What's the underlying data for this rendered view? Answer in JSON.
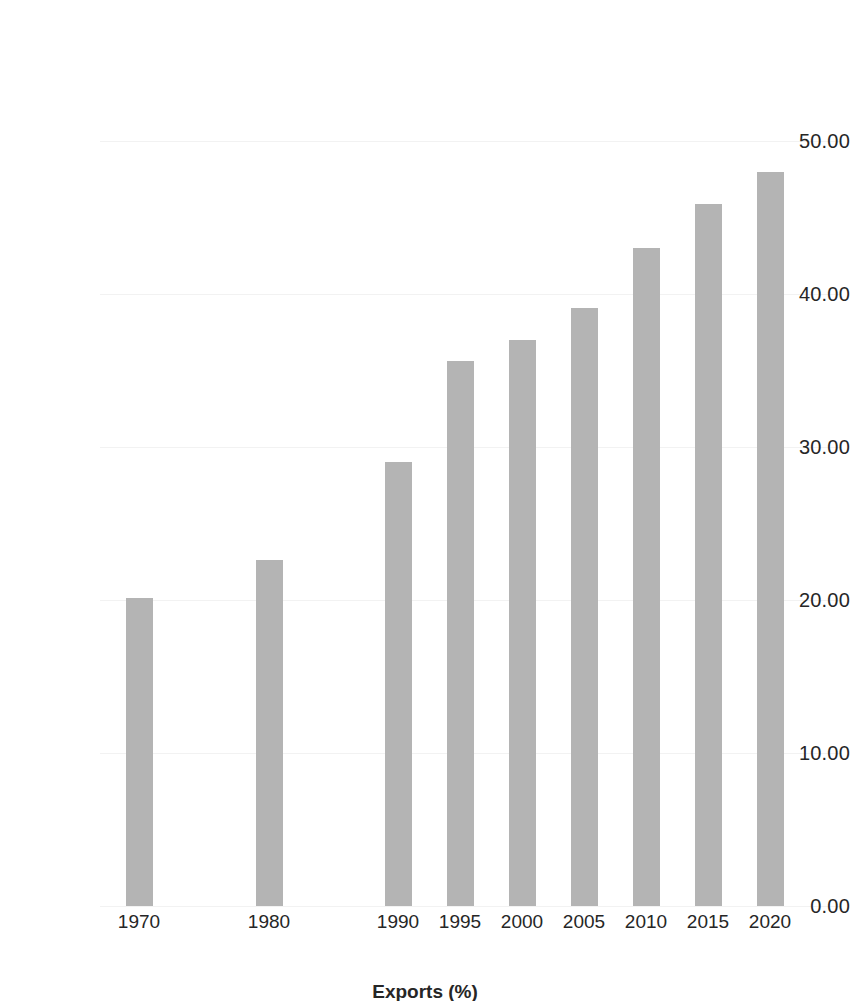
{
  "chart_data": {
    "type": "bar",
    "title": "",
    "subtitle": "",
    "xlabel": "",
    "ylabel": "",
    "categories": [
      "1970",
      "1980",
      "1990",
      "1995",
      "2000",
      "2005",
      "2010",
      "2015",
      "2020"
    ],
    "values": [
      20.1,
      22.6,
      29.0,
      35.6,
      37.0,
      39.1,
      43.0,
      45.9,
      48.0
    ],
    "series": [
      {
        "name": "Exports (%)",
        "values": [
          20.1,
          22.6,
          29.0,
          35.6,
          37.0,
          39.1,
          43.0,
          45.9,
          48.0
        ]
      }
    ],
    "ylim": [
      0,
      50
    ],
    "ytick_labels": [
      "50.00",
      "40.00",
      "30.00",
      "20.00",
      "10.00",
      "0.00"
    ],
    "ytick_values": [
      50,
      40,
      30,
      20,
      10,
      0
    ],
    "xtick_labels": [
      "1970",
      "1980",
      "1990",
      "1995",
      "2000",
      "2005",
      "2010",
      "2015",
      "2020"
    ],
    "grid": true,
    "legend": "none",
    "bar_color": "#b4b4b4",
    "gridline_color": "#f2f2f2",
    "text_color": "#262626",
    "background_color": "#ffffff",
    "axis_caption": "Exports (%)"
  },
  "axis": {
    "caption_partial": "Exports (%)"
  }
}
